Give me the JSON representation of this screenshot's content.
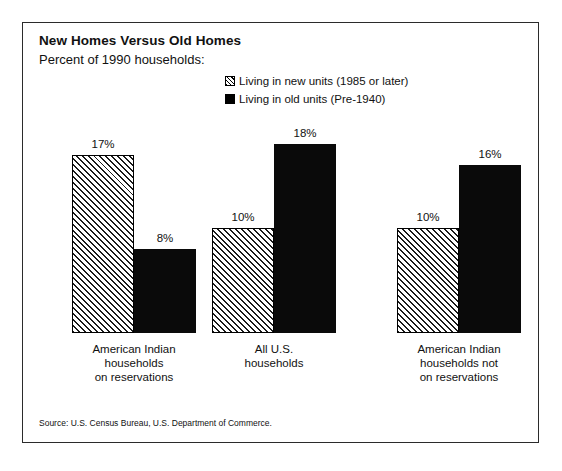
{
  "header": {
    "title": "New Homes Versus Old Homes",
    "subtitle": "Percent of 1990 households:"
  },
  "legend": {
    "items": [
      {
        "label": "Living in new units (1985 or later)",
        "swatch": "hatched-square-icon"
      },
      {
        "label": "Living in old units (Pre-1940)",
        "swatch": "solid-square-icon"
      }
    ]
  },
  "source": {
    "text": "Source:  U.S. Census Bureau, U.S. Department of Commerce."
  },
  "colors": {
    "frame": "#2b2b2b",
    "solid_bar": "#0a0a0a",
    "hatch_line": "#1a1a1a",
    "background": "#ffffff",
    "text": "#111111"
  },
  "chart_data": {
    "type": "bar",
    "title": "New Homes Versus Old Homes",
    "subtitle": "Percent of 1990 households:",
    "xlabel": "",
    "ylabel": "Percent of 1990 households",
    "ylim": [
      0,
      18
    ],
    "grid": false,
    "legend_position": "top-center",
    "axis_visible": false,
    "categories": [
      "American Indian\nhouseholds\non reservations",
      "All U.S.\nhouseholds",
      "American Indian\nhouseholds not\non reservations"
    ],
    "series": [
      {
        "name": "Living in new units (1985 or later)",
        "fill": "hatched",
        "values": [
          17,
          10,
          10
        ],
        "value_labels": [
          "17%",
          "10%",
          "10%"
        ]
      },
      {
        "name": "Living in old units (Pre-1940)",
        "fill": "solid",
        "values": [
          8,
          18,
          16
        ],
        "value_labels": [
          "8%",
          "18%",
          "16%"
        ]
      }
    ],
    "annotations": [
      "Source:  U.S. Census Bureau, U.S. Department of Commerce."
    ]
  }
}
